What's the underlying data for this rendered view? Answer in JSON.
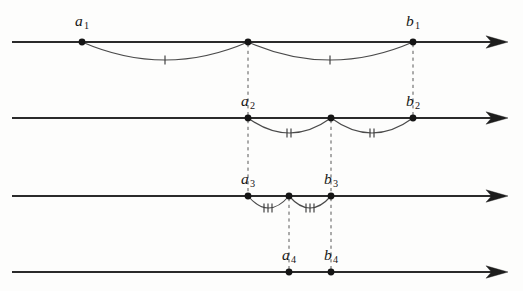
{
  "figure": {
    "type": "math-diagram",
    "width": 523,
    "height": 291,
    "background_color": "#fdfdfc",
    "line_color": "#2b2b2b",
    "arc_color": "#4a4a4a",
    "dash_color": "#585858",
    "dot_color": "#151515"
  },
  "lines": [
    {
      "name": "number-line-1",
      "y": 42,
      "x_start": 12,
      "x_end": 508,
      "arrow": "right"
    },
    {
      "name": "number-line-2",
      "y": 118,
      "x_start": 12,
      "x_end": 508,
      "arrow": "right"
    },
    {
      "name": "number-line-3",
      "y": 196,
      "x_start": 12,
      "x_end": 508,
      "arrow": "right"
    },
    {
      "name": "number-line-4",
      "y": 272,
      "x_start": 12,
      "x_end": 508,
      "arrow": "right"
    }
  ],
  "points": [
    {
      "id": "a1",
      "label_base": "a",
      "label_sub": "1",
      "x": 82,
      "y": 42,
      "label_x": 82,
      "label_y": 26,
      "labeled": true
    },
    {
      "id": "m1",
      "label_base": "",
      "label_sub": "",
      "x": 248,
      "y": 42,
      "label_x": 248,
      "label_y": 26,
      "labeled": false
    },
    {
      "id": "b1",
      "label_base": "b",
      "label_sub": "1",
      "x": 413,
      "y": 42,
      "label_x": 413,
      "label_y": 26,
      "labeled": true
    },
    {
      "id": "a2",
      "label_base": "a",
      "label_sub": "2",
      "x": 248,
      "y": 118,
      "label_x": 248,
      "label_y": 106,
      "labeled": true
    },
    {
      "id": "m2",
      "label_base": "",
      "label_sub": "",
      "x": 331,
      "y": 118,
      "label_x": 331,
      "label_y": 106,
      "labeled": false
    },
    {
      "id": "b2",
      "label_base": "b",
      "label_sub": "2",
      "x": 413,
      "y": 118,
      "label_x": 413,
      "label_y": 106,
      "labeled": true
    },
    {
      "id": "a3",
      "label_base": "a",
      "label_sub": "3",
      "x": 248,
      "y": 196,
      "label_x": 248,
      "label_y": 184,
      "labeled": true
    },
    {
      "id": "m3",
      "label_base": "",
      "label_sub": "",
      "x": 289,
      "y": 196,
      "label_x": 289,
      "label_y": 184,
      "labeled": false
    },
    {
      "id": "b3",
      "label_base": "b",
      "label_sub": "3",
      "x": 331,
      "y": 196,
      "label_x": 331,
      "label_y": 184,
      "labeled": true
    },
    {
      "id": "a4",
      "label_base": "a",
      "label_sub": "4",
      "x": 289,
      "y": 272,
      "label_x": 289,
      "label_y": 260,
      "labeled": true
    },
    {
      "id": "b4",
      "label_base": "b",
      "label_sub": "4",
      "x": 331,
      "y": 272,
      "label_x": 331,
      "label_y": 260,
      "labeled": true
    }
  ],
  "arcs": [
    {
      "id": "arc-1-left",
      "x1": 82,
      "x2": 248,
      "y": 42,
      "sag": 18,
      "ticks": 1,
      "tick_cx": 165,
      "tick_cy": 60
    },
    {
      "id": "arc-1-right",
      "x1": 248,
      "x2": 413,
      "y": 42,
      "sag": 18,
      "ticks": 1,
      "tick_cx": 330,
      "tick_cy": 60
    },
    {
      "id": "arc-2-left",
      "x1": 248,
      "x2": 331,
      "y": 118,
      "sag": 15,
      "ticks": 2,
      "tick_cx": 289,
      "tick_cy": 133
    },
    {
      "id": "arc-2-right",
      "x1": 331,
      "x2": 413,
      "y": 118,
      "sag": 15,
      "ticks": 2,
      "tick_cx": 372,
      "tick_cy": 133
    },
    {
      "id": "arc-3-left",
      "x1": 248,
      "x2": 289,
      "y": 196,
      "sag": 12,
      "ticks": 3,
      "tick_cx": 268,
      "tick_cy": 208
    },
    {
      "id": "arc-3-right",
      "x1": 289,
      "x2": 331,
      "y": 196,
      "sag": 12,
      "ticks": 3,
      "tick_cx": 310,
      "tick_cy": 208
    }
  ],
  "connectors": [
    {
      "id": "dash-mid1-to-a2",
      "x": 248,
      "y1": 44,
      "y2": 116,
      "from": "m1",
      "to": "a2"
    },
    {
      "id": "dash-b1-to-b2",
      "x": 413,
      "y1": 44,
      "y2": 116,
      "from": "b1",
      "to": "b2"
    },
    {
      "id": "dash-a2-to-a3",
      "x": 248,
      "y1": 120,
      "y2": 194,
      "from": "a2",
      "to": "a3"
    },
    {
      "id": "dash-mid2-to-b3",
      "x": 331,
      "y1": 120,
      "y2": 194,
      "from": "m2",
      "to": "b3"
    },
    {
      "id": "dash-mid3-to-a4",
      "x": 289,
      "y1": 198,
      "y2": 270,
      "from": "m3",
      "to": "a4"
    },
    {
      "id": "dash-b3-to-b4",
      "x": 331,
      "y1": 198,
      "y2": 270,
      "from": "b3",
      "to": "b4"
    }
  ],
  "arrow_heads": [
    {
      "id": "arrow-head-1",
      "tip_x": 508,
      "y": 42
    },
    {
      "id": "arrow-head-2",
      "tip_x": 508,
      "y": 118
    },
    {
      "id": "arrow-head-3",
      "tip_x": 508,
      "y": 196
    },
    {
      "id": "arrow-head-4",
      "tip_x": 508,
      "y": 272
    }
  ]
}
